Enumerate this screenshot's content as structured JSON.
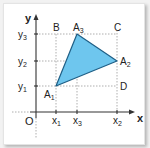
{
  "diagram": {
    "axis_labels": {
      "x": "x",
      "y": "y",
      "origin": "O"
    },
    "x_ticks": [
      {
        "label": "x",
        "sub": "1",
        "px": 56
      },
      {
        "label": "x",
        "sub": "3",
        "px": 77
      },
      {
        "label": "x",
        "sub": "2",
        "px": 117
      }
    ],
    "y_ticks": [
      {
        "label": "y",
        "sub": "3",
        "py": 34
      },
      {
        "label": "y",
        "sub": "2",
        "py": 61
      },
      {
        "label": "y",
        "sub": "1",
        "py": 86
      }
    ],
    "triangle": {
      "fill": "#6ec6ee",
      "stroke": "#1f5f86",
      "vertices": [
        {
          "name": "A",
          "sub": "1",
          "x": 56,
          "y": 86
        },
        {
          "name": "A",
          "sub": "2",
          "x": 117,
          "y": 61
        },
        {
          "name": "A",
          "sub": "3",
          "x": 77,
          "y": 34
        }
      ]
    },
    "corner_points": [
      {
        "name": "B",
        "x": 56,
        "y": 34
      },
      {
        "name": "C",
        "x": 117,
        "y": 34
      },
      {
        "name": "D",
        "x": 117,
        "y": 86
      }
    ]
  }
}
